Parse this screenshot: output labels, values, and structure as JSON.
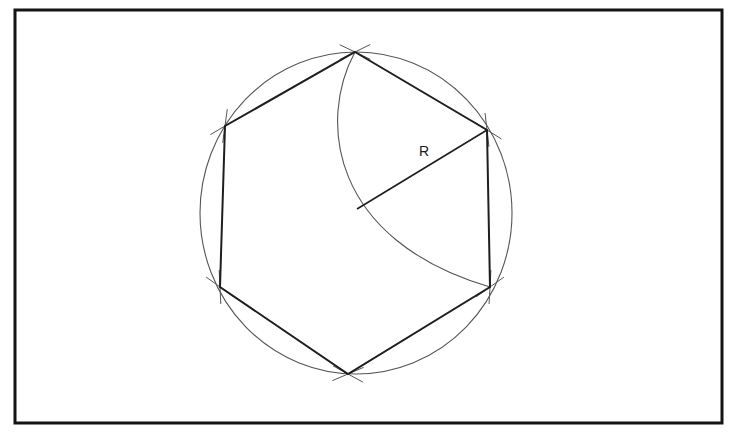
{
  "diagram": {
    "radius_label": "R",
    "colors": {
      "frame": "#141414",
      "hexagon": "#1e1e1e",
      "construction": "#555555",
      "background": "#ffffff"
    },
    "frame": {
      "x": 15,
      "y": 10,
      "width": 707,
      "height": 413,
      "stroke_width": 3
    },
    "circle": {
      "cx": 356,
      "cy": 213,
      "rx": 156,
      "ry": 161
    },
    "vertices": [
      {
        "name": "top",
        "x": 355,
        "y": 52
      },
      {
        "name": "upper-right",
        "x": 487,
        "y": 130
      },
      {
        "name": "lower-right",
        "x": 490,
        "y": 287
      },
      {
        "name": "bottom",
        "x": 348,
        "y": 374
      },
      {
        "name": "lower-left",
        "x": 220,
        "y": 287
      },
      {
        "name": "upper-left",
        "x": 225,
        "y": 126
      }
    ],
    "radius_line": {
      "x1": 487,
      "y1": 130,
      "x2": 357,
      "y2": 209
    },
    "radius_label_pos": {
      "x": 419,
      "y": 143
    }
  }
}
